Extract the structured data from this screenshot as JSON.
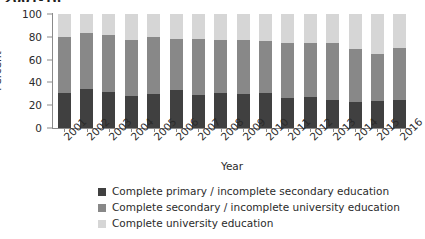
{
  "title_fragment": "2001-16",
  "chart_data": {
    "type": "bar",
    "subtype": "stacked-vertical-100",
    "title": "2001-16",
    "xlabel": "Year",
    "ylabel": "Percent",
    "ylim": [
      0,
      100
    ],
    "yticks": [
      0,
      20,
      40,
      60,
      80,
      100
    ],
    "grid": false,
    "legend_position": "bottom",
    "categories": [
      "2001",
      "2002",
      "2003",
      "2004",
      "2005",
      "2006",
      "2007",
      "2008",
      "2009",
      "2010",
      "2011",
      "2012",
      "2013",
      "2014",
      "2015",
      "2016"
    ],
    "series": [
      {
        "name": "Complete primary / incomplete secondary education",
        "color": "#404040",
        "values": [
          31,
          34,
          32,
          28,
          30,
          33,
          29,
          31,
          30,
          31,
          26,
          27,
          25,
          23,
          24,
          25
        ]
      },
      {
        "name": "Complete secondary / incomplete university education",
        "color": "#888888",
        "values": [
          49,
          49,
          50,
          49,
          50,
          45,
          49,
          46,
          47,
          45,
          49,
          48,
          50,
          46,
          41,
          45
        ]
      },
      {
        "name": "Complete university education",
        "color": "#d6d6d6",
        "values": [
          20,
          17,
          18,
          23,
          20,
          22,
          22,
          23,
          23,
          24,
          25,
          25,
          25,
          31,
          35,
          30
        ]
      }
    ]
  },
  "legend": [
    {
      "label": "Complete primary / incomplete secondary education",
      "color": "#404040"
    },
    {
      "label": "Complete secondary / incomplete university education",
      "color": "#888888"
    },
    {
      "label": "Complete university education",
      "color": "#d6d6d6"
    }
  ]
}
